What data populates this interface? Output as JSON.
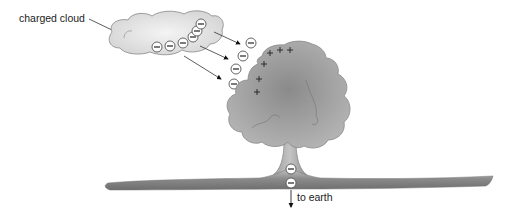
{
  "diagram": {
    "labels": {
      "cloud": "charged cloud",
      "earth": "to earth"
    },
    "symbols": {
      "negative": "−",
      "positive": "+"
    },
    "colors": {
      "cloud_fill": "#e2e2e2",
      "tree_fill": "#9a9a9a",
      "ground_fill": "#8c8c8c",
      "outline": "#777777",
      "text": "#222222"
    },
    "cloud_charges": {
      "sign": "negative",
      "count": 6
    },
    "air_charges": {
      "sign": "negative",
      "count": 4
    },
    "tree_charges": {
      "sign": "positive",
      "count": 6
    },
    "trunk_charges": {
      "sign": "negative",
      "count": 2
    },
    "arrows": {
      "cloud_to_tree": 3,
      "to_earth": 1
    }
  }
}
